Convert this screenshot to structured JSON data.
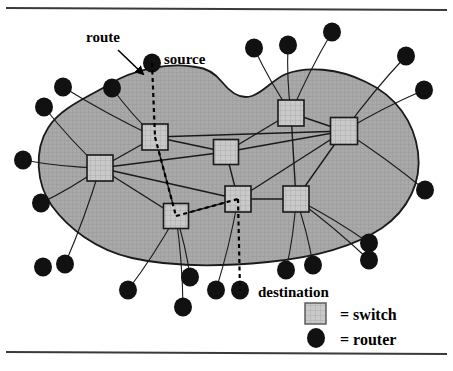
{
  "figure": {
    "title_rule_top": true,
    "title_rule_bottom": true,
    "background_color": "#ffffff",
    "cloud_fill_color": "#a8a8a8",
    "cloud_stroke_color": "#1a1a1a",
    "switch_fill_color": "#c6c6c6",
    "switch_stroke_color": "#1a1a1a",
    "router_fill_color": "#111111",
    "link_color": "#1a1a1a",
    "route_color": "#000000"
  },
  "annotations": {
    "route": "route",
    "source": "source",
    "destination": "destination"
  },
  "legend": {
    "switch": "= switch",
    "router": "= router"
  },
  "chart_data": {
    "type": "diagram",
    "title": "",
    "cloud_outline": "M 196 67 C 168 62, 132 70, 110 84 C 88 97, 60 108, 48 128 C 34 150, 36 184, 52 206 C 68 228, 96 250, 132 258 C 176 268, 228 266, 268 262 C 308 258, 352 248, 382 228 C 408 210, 422 182, 418 152 C 414 122, 396 96, 366 82 C 338 68, 306 66, 286 74 C 272 80, 264 92, 252 96 C 240 100, 230 92, 222 82 C 214 72, 206 68, 196 67 Z",
    "switches": [
      {
        "id": "S_left",
        "label": "",
        "x": 100,
        "y": 168,
        "size": 26
      },
      {
        "id": "S_topleft",
        "label": "",
        "x": 155,
        "y": 137,
        "size": 26
      },
      {
        "id": "S_center",
        "label": "",
        "x": 226,
        "y": 152,
        "size": 25
      },
      {
        "id": "S_lowleft",
        "label": "",
        "x": 176,
        "y": 216,
        "size": 25
      },
      {
        "id": "S_lowmid",
        "label": "",
        "x": 238,
        "y": 199,
        "size": 26
      },
      {
        "id": "S_lowright",
        "label": "",
        "x": 296,
        "y": 199,
        "size": 26
      },
      {
        "id": "S_topright",
        "label": "",
        "x": 291,
        "y": 113,
        "size": 26
      },
      {
        "id": "S_right",
        "label": "",
        "x": 344,
        "y": 131,
        "size": 27
      }
    ],
    "routers": [
      {
        "id": "R_source",
        "x": 152,
        "y": 63,
        "r": 9,
        "label": "source"
      },
      {
        "id": "R_t1",
        "x": 254,
        "y": 48,
        "r": 9,
        "label": ""
      },
      {
        "id": "R_t2",
        "x": 288,
        "y": 45,
        "r": 9,
        "label": ""
      },
      {
        "id": "R_t3",
        "x": 332,
        "y": 32,
        "r": 9,
        "label": ""
      },
      {
        "id": "R_r1",
        "x": 406,
        "y": 56,
        "r": 9,
        "label": ""
      },
      {
        "id": "R_r2",
        "x": 424,
        "y": 90,
        "r": 9,
        "label": ""
      },
      {
        "id": "R_r3",
        "x": 425,
        "y": 190,
        "r": 9,
        "label": ""
      },
      {
        "id": "R_br1",
        "x": 369,
        "y": 243,
        "r": 9,
        "label": ""
      },
      {
        "id": "R_br2",
        "x": 369,
        "y": 260,
        "r": 9,
        "label": ""
      },
      {
        "id": "R_b1",
        "x": 286,
        "y": 270,
        "r": 9,
        "label": ""
      },
      {
        "id": "R_b2",
        "x": 313,
        "y": 265,
        "r": 9,
        "label": ""
      },
      {
        "id": "R_dest",
        "x": 240,
        "y": 290,
        "r": 9,
        "label": "destination"
      },
      {
        "id": "R_b3",
        "x": 216,
        "y": 290,
        "r": 9,
        "label": ""
      },
      {
        "id": "R_b4",
        "x": 190,
        "y": 277,
        "r": 9,
        "label": ""
      },
      {
        "id": "R_b5",
        "x": 183,
        "y": 307,
        "r": 9,
        "label": ""
      },
      {
        "id": "R_b6",
        "x": 128,
        "y": 290,
        "r": 9,
        "label": ""
      },
      {
        "id": "R_bl1",
        "x": 65,
        "y": 264,
        "r": 9,
        "label": ""
      },
      {
        "id": "R_bl2",
        "x": 43,
        "y": 267,
        "r": 9,
        "label": ""
      },
      {
        "id": "R_l1",
        "x": 23,
        "y": 160,
        "r": 9,
        "label": ""
      },
      {
        "id": "R_l2",
        "x": 41,
        "y": 203,
        "r": 9,
        "label": ""
      },
      {
        "id": "R_tl1",
        "x": 44,
        "y": 107,
        "r": 9,
        "label": ""
      },
      {
        "id": "R_tl2",
        "x": 63,
        "y": 87,
        "r": 9,
        "label": ""
      },
      {
        "id": "R_tl3",
        "x": 112,
        "y": 88,
        "r": 9,
        "label": ""
      }
    ],
    "links": [
      {
        "from": "S_left",
        "to": "S_topleft"
      },
      {
        "from": "S_left",
        "to": "S_center"
      },
      {
        "from": "S_left",
        "to": "S_lowleft"
      },
      {
        "from": "S_left",
        "to": "S_lowmid"
      },
      {
        "from": "S_topleft",
        "to": "S_center"
      },
      {
        "from": "S_topleft",
        "to": "S_right"
      },
      {
        "from": "S_topleft",
        "to": "S_lowleft"
      },
      {
        "from": "S_center",
        "to": "S_topright"
      },
      {
        "from": "S_center",
        "to": "S_lowmid"
      },
      {
        "from": "S_center",
        "to": "S_right"
      },
      {
        "from": "S_topright",
        "to": "S_right"
      },
      {
        "from": "S_topright",
        "to": "S_lowright"
      },
      {
        "from": "S_right",
        "to": "S_lowright"
      },
      {
        "from": "S_right",
        "to": "S_lowmid"
      },
      {
        "from": "S_lowleft",
        "to": "S_lowmid"
      },
      {
        "from": "S_lowmid",
        "to": "S_lowright"
      }
    ],
    "access_links": [
      {
        "router": "R_t1",
        "switch": "S_topright"
      },
      {
        "router": "R_t2",
        "switch": "S_topright"
      },
      {
        "router": "R_t3",
        "switch": "S_topright"
      },
      {
        "router": "R_r1",
        "switch": "S_right"
      },
      {
        "router": "R_r2",
        "switch": "S_right"
      },
      {
        "router": "R_r3",
        "switch": "S_right"
      },
      {
        "router": "R_br1",
        "switch": "S_lowright"
      },
      {
        "router": "R_br2",
        "switch": "S_lowright"
      },
      {
        "router": "R_b1",
        "switch": "S_lowright"
      },
      {
        "router": "R_b2",
        "switch": "S_lowright"
      },
      {
        "router": "R_b3",
        "switch": "S_lowmid"
      },
      {
        "router": "R_b4",
        "switch": "S_lowleft"
      },
      {
        "router": "R_b5",
        "switch": "S_lowleft"
      },
      {
        "router": "R_b6",
        "switch": "S_lowleft"
      },
      {
        "router": "R_bl1",
        "switch": "S_left"
      },
      {
        "router": "R_l1",
        "switch": "S_left"
      },
      {
        "router": "R_l2",
        "switch": "S_left"
      },
      {
        "router": "R_tl1",
        "switch": "S_left"
      },
      {
        "router": "R_tl2",
        "switch": "S_topleft"
      },
      {
        "router": "R_tl3",
        "switch": "S_topleft"
      }
    ],
    "route_path": [
      "R_source",
      "S_topleft",
      "S_lowleft",
      "S_lowmid",
      "R_dest"
    ],
    "arrow": {
      "from_x": 118,
      "from_y": 50,
      "to_x": 143,
      "to_y": 74
    }
  }
}
